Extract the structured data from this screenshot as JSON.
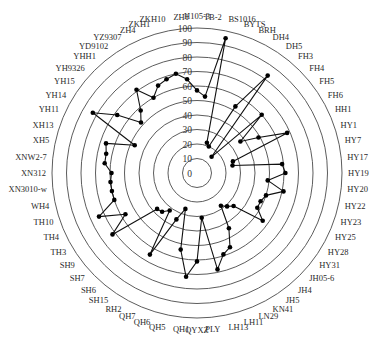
{
  "chart_data": {
    "type": "line",
    "subtype": "radar",
    "projection": "polar",
    "title": "",
    "xlabel": "",
    "ylabel": "",
    "rlim": [
      0,
      100
    ],
    "radial_ticks": [
      0,
      10,
      20,
      30,
      40,
      50,
      60,
      70,
      80,
      90,
      100
    ],
    "grid": true,
    "legend": null,
    "colors": {
      "grid": "#4a4a4a",
      "series": "#111111",
      "marker": "#000000"
    },
    "categories": [
      "H105-3",
      "TB-2",
      "BS1016",
      "BYTS",
      "BRH",
      "DH4",
      "DH5",
      "FH3",
      "FH4",
      "FH5",
      "FH6",
      "HH1",
      "HY1",
      "HY7",
      "HY17",
      "HY19",
      "HY20",
      "HY22",
      "HY23",
      "HY25",
      "HY28",
      "HY31",
      "JH05-6",
      "JH4",
      "JH5",
      "KN41",
      "LN29",
      "LH11",
      "LH13",
      "PLY",
      "QYXZ",
      "QH1",
      "QH5",
      "QH6",
      "QH7",
      "RH2",
      "SH15",
      "SH6",
      "SH7",
      "SH9",
      "TH3",
      "TH4",
      "TH10",
      "WH4",
      "XN3010-w",
      "XN312",
      "XNW2-7",
      "XH5",
      "XH13",
      "YH11",
      "YH14",
      "YH15",
      "YH9326",
      "YHH1",
      "YD9102",
      "YZ9307",
      "ZH4",
      "ZKH1",
      "ZKH10",
      "ZH1"
    ],
    "values": [
      57,
      53,
      95,
      22,
      20,
      53,
      83,
      15,
      60,
      37,
      49,
      68,
      26,
      25,
      59,
      61,
      49,
      61,
      50,
      48,
      48,
      56,
      34,
      31,
      28,
      44,
      56,
      59,
      68,
      31,
      61,
      72,
      54,
      26,
      35,
      65,
      32,
      36,
      37,
      72,
      57,
      74,
      60,
      60,
      60,
      59,
      64,
      64,
      66,
      47,
      83,
      68,
      52,
      58,
      71,
      60,
      66,
      68,
      70,
      65
    ],
    "series": [
      {
        "name": "",
        "marker": "filled-circle"
      }
    ]
  }
}
